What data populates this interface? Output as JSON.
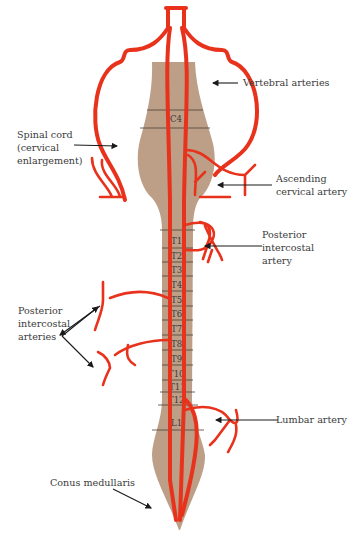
{
  "diagram": {
    "colors": {
      "cord": "#bd9e87",
      "artery": "#e8321c",
      "text": "#3a3a3a",
      "background": "#ffffff"
    },
    "labels": {
      "vertebral": "Vertebral arteries",
      "spinal_cord_1": "Spinal cord",
      "spinal_cord_2": "(cervical",
      "spinal_cord_3": "enlargement)",
      "ascending_1": "Ascending",
      "ascending_2": "cervical artery",
      "post_intercostal_r_1": "Posterior",
      "post_intercostal_r_2": "intercostal",
      "post_intercostal_r_3": "artery",
      "post_intercostal_l_1": "Posterior",
      "post_intercostal_l_2": "intercostal",
      "post_intercostal_l_3": "arteries",
      "lumbar": "Lumbar artery",
      "conus": "Conus medullaris"
    },
    "segments": {
      "c4": "C4",
      "t1": "T1",
      "t2": "T2",
      "t3": "T3",
      "t4": "T4",
      "t5": "T5",
      "t6": "T6",
      "t7": "T7",
      "t8": "T8",
      "t9": "T9",
      "t10": "T10",
      "t11": "T11",
      "t12": "T12",
      "l1": "L1"
    }
  }
}
